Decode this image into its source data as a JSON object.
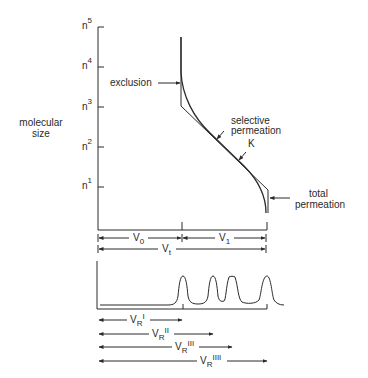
{
  "diagram": {
    "y_axis": {
      "title_line1": "molecular",
      "title_line2": "size",
      "ticks": [
        {
          "base": "n",
          "exp": "5"
        },
        {
          "base": "n",
          "exp": "4"
        },
        {
          "base": "n",
          "exp": "3"
        },
        {
          "base": "n",
          "exp": "2"
        },
        {
          "base": "n",
          "exp": "1"
        }
      ]
    },
    "annotations": {
      "exclusion": "exclusion",
      "selective_line1": "selective",
      "selective_line2": "permeation",
      "k": "K",
      "total_line1": "total",
      "total_line2": "permeation"
    },
    "volumes": {
      "v0": {
        "main": "V",
        "sub": "0"
      },
      "v1": {
        "main": "V",
        "sub": "1"
      },
      "vt": {
        "main": "V",
        "sub": "t"
      }
    },
    "retention": [
      {
        "main": "V",
        "sub": "R",
        "sup": "I"
      },
      {
        "main": "V",
        "sub": "R",
        "sup": "II"
      },
      {
        "main": "V",
        "sub": "R",
        "sup": "III"
      },
      {
        "main": "V",
        "sub": "R",
        "sup": "IIII"
      }
    ],
    "chromatogram": {
      "peaks": 4,
      "peak_positions_relative": [
        "V0",
        "VRII",
        "VRIII",
        "Vt"
      ]
    }
  }
}
